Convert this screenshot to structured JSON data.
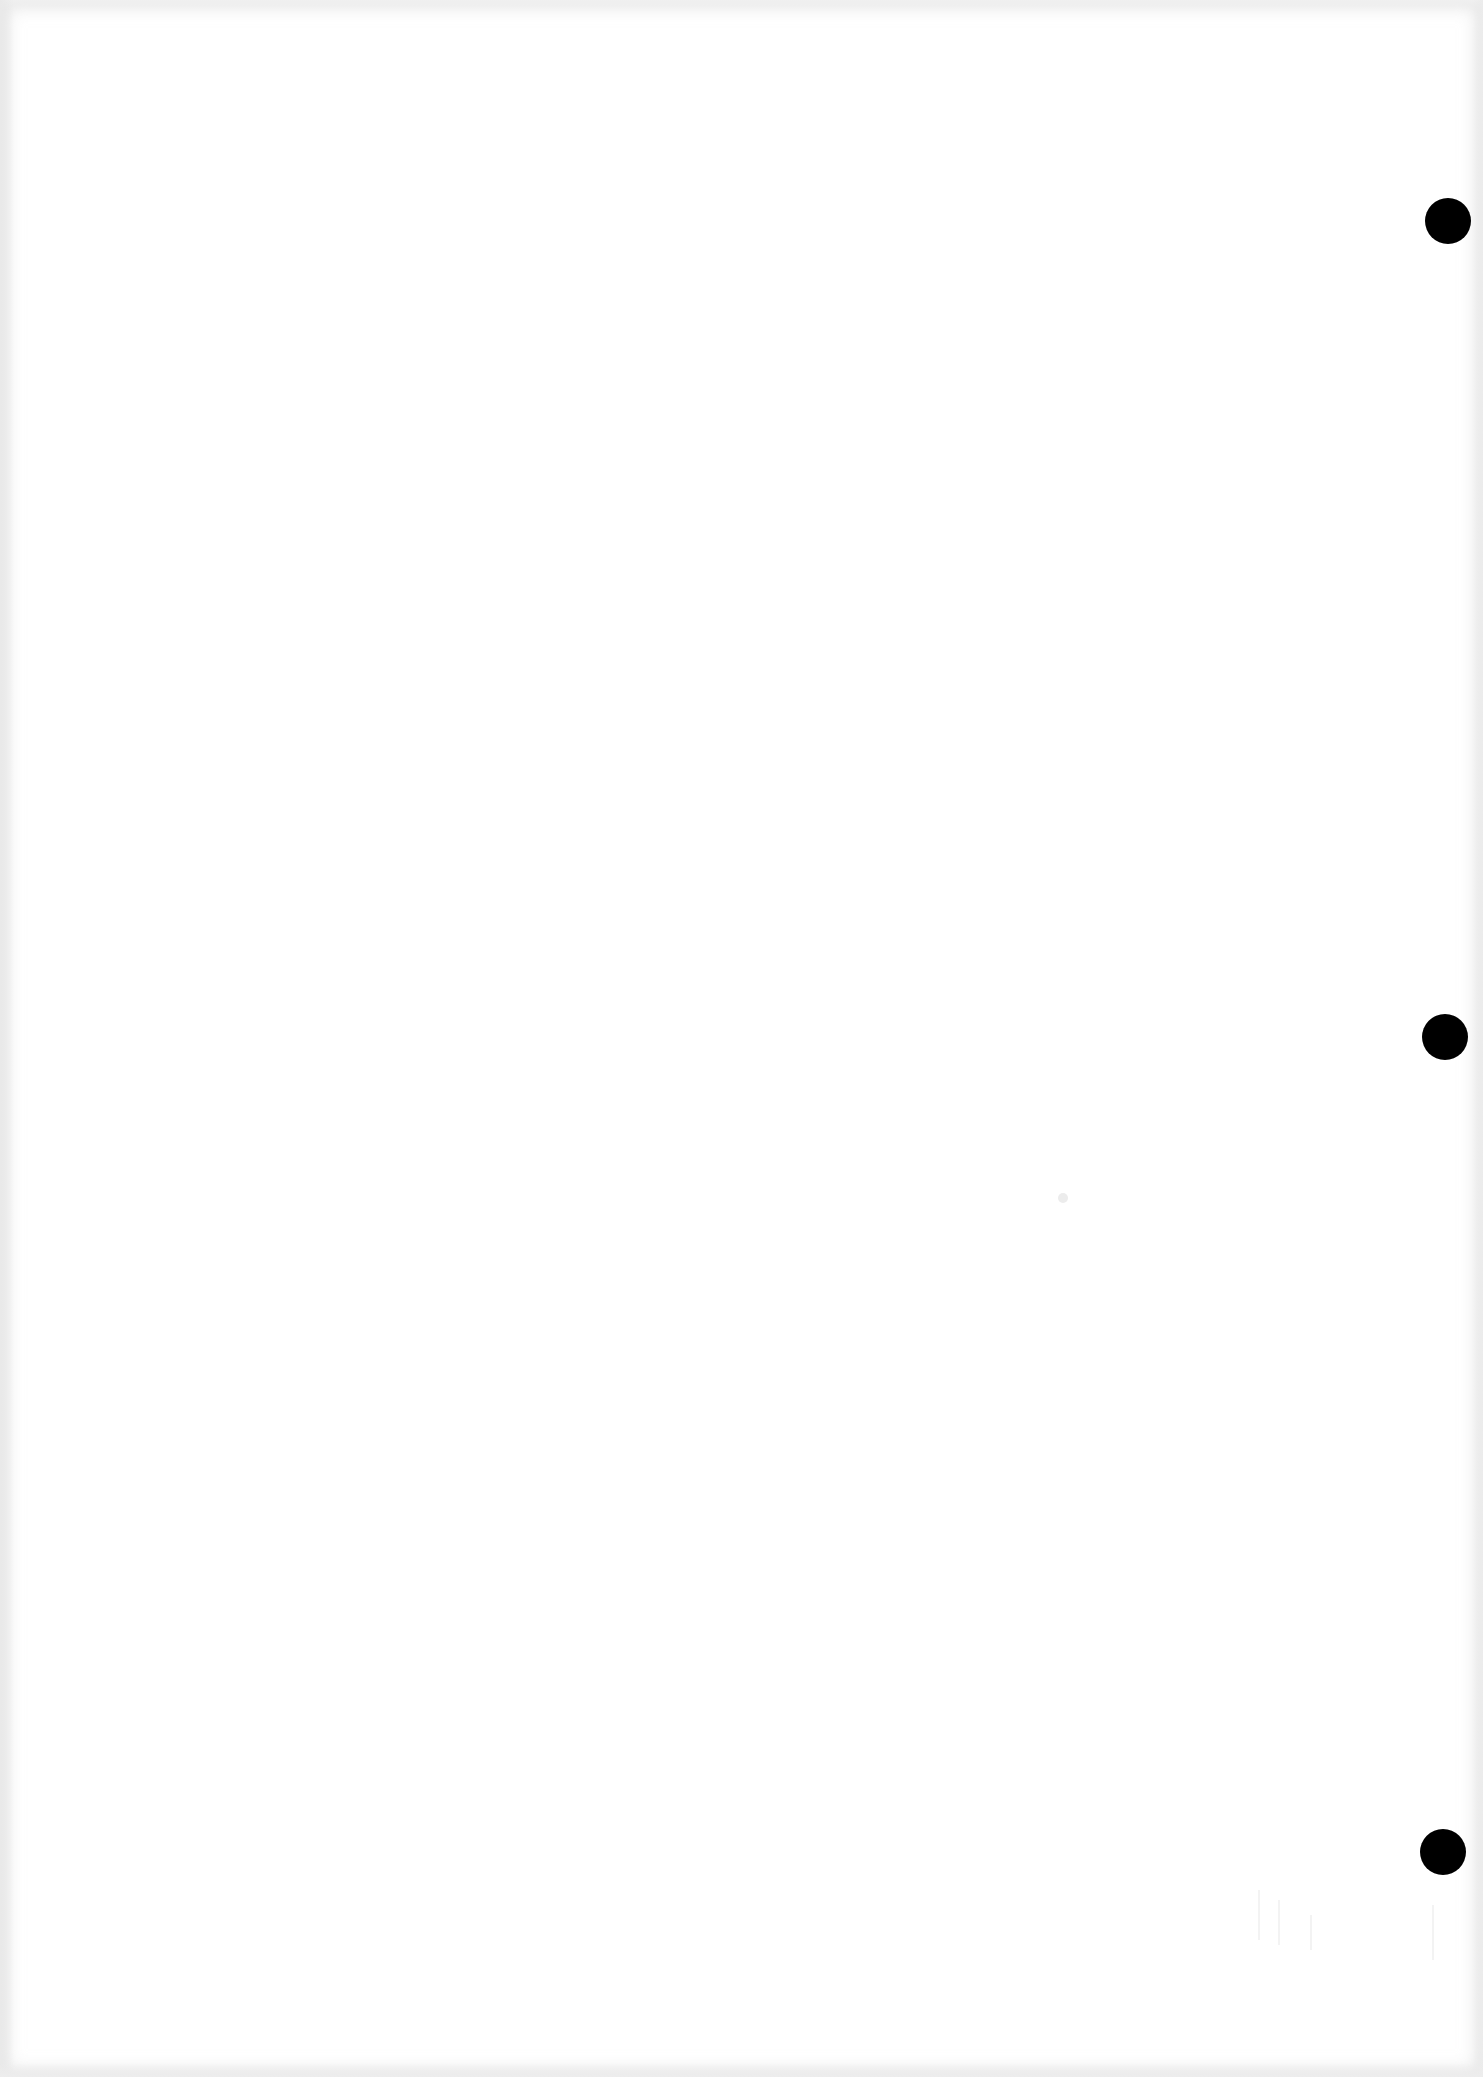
{
  "page": {
    "type": "scanned-blank-page",
    "background_color": "#ffffff",
    "visible_text": ""
  },
  "punch_holes": [
    {
      "cx": 1448,
      "cy": 221,
      "diameter": 46,
      "color": "#000000"
    },
    {
      "cx": 1445,
      "cy": 1037,
      "diameter": 46,
      "color": "#000000"
    },
    {
      "cx": 1443,
      "cy": 1852,
      "diameter": 46,
      "color": "#000000"
    }
  ]
}
